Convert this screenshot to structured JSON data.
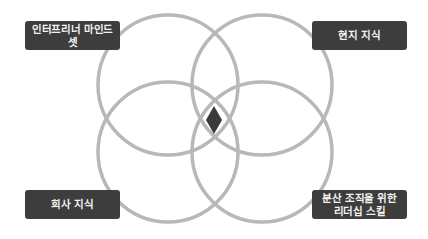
{
  "diagram": {
    "type": "venn-4",
    "colors": {
      "circle_stroke": "#b8b8b8",
      "label_background": "#3d3d3d",
      "label_text": "#f2f2f2",
      "center_diamond": "#3a3a3a"
    },
    "labels": {
      "top_left": "인터프리너 마인드셋",
      "top_right": "현지 지식",
      "bottom_left": "회사 지식",
      "bottom_right_line1": "분산 조직을 위한",
      "bottom_right_line2": "리더십 스킬"
    },
    "circles": [
      {
        "name": "entrepreneur-mindset",
        "position": "top-left"
      },
      {
        "name": "local-knowledge",
        "position": "top-right"
      },
      {
        "name": "company-knowledge",
        "position": "bottom-left"
      },
      {
        "name": "distributed-leadership-skills",
        "position": "bottom-right"
      }
    ],
    "center_marker": "diamond"
  }
}
